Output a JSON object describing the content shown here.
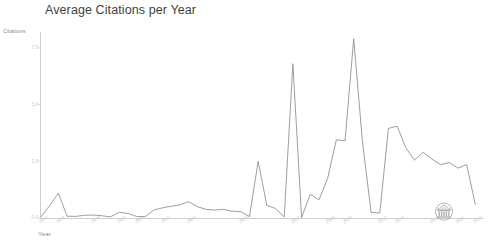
{
  "chart_data": {
    "type": "line",
    "title": "Average Citations per Year",
    "xlabel": "Year",
    "ylabel": "Citations",
    "grid": false,
    "legend": null,
    "ylim": [
      0,
      8.2
    ],
    "yticks": [
      0,
      2.5,
      5.0,
      7.5
    ],
    "ytick_labels": [
      "0.0",
      "2.5",
      "5.0",
      "7.5"
    ],
    "xlim": [
      1973,
      2024
    ],
    "xtick_labels": [
      "1973",
      "1975",
      "1979",
      "1982",
      "1984",
      "1987",
      "1990",
      "1996",
      "2002",
      "2006",
      "2008",
      "2012",
      "2014",
      "2018",
      "2021",
      "2023"
    ],
    "series": [
      {
        "name": "Average Citations per Year",
        "color": "#8c8c8c",
        "x": [
          1973,
          1974,
          1975,
          1976,
          1977,
          1978,
          1979,
          1980,
          1981,
          1982,
          1983,
          1984,
          1985,
          1986,
          1987,
          1988,
          1989,
          1990,
          1991,
          1992,
          1993,
          1994,
          1995,
          1996,
          1997,
          1998,
          1999,
          2000,
          2001,
          2002,
          2003,
          2004,
          2005,
          2006,
          2007,
          2008,
          2009,
          2010,
          2011,
          2012,
          2013,
          2014,
          2015,
          2016,
          2017,
          2018,
          2019,
          2020,
          2021,
          2022,
          2023
        ],
        "values": [
          0.05,
          0.55,
          1.1,
          0.08,
          0.07,
          0.12,
          0.13,
          0.1,
          0.05,
          0.25,
          0.2,
          0.07,
          0.06,
          0.35,
          0.45,
          0.52,
          0.58,
          0.72,
          0.5,
          0.38,
          0.35,
          0.38,
          0.3,
          0.28,
          0.06,
          2.5,
          0.55,
          0.42,
          0.05,
          6.8,
          0.02,
          1.05,
          0.8,
          1.75,
          3.45,
          3.4,
          7.9,
          3.4,
          0.25,
          0.22,
          3.95,
          4.05,
          3.1,
          2.55,
          2.9,
          2.6,
          2.35,
          2.45,
          2.2,
          2.35,
          0.6
        ]
      }
    ]
  },
  "watermark": {
    "name": "institution-seal-watermark",
    "description": "circular seal with classical temple facade"
  },
  "colors": {
    "line": "#8c8c8c",
    "axis": "#cfcfcf",
    "title_text": "#3f3f3f",
    "tick_text": "#c6c6c6",
    "background": "#ffffff"
  }
}
